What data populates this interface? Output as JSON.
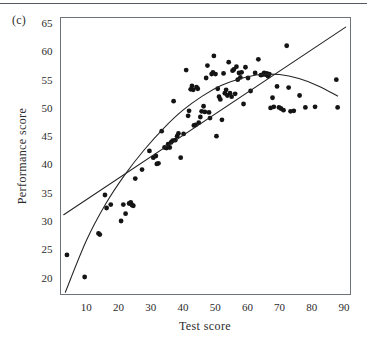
{
  "figure": {
    "panel_label": "(c)",
    "background_color": "#ffffff",
    "rule_color": "#555a60"
  },
  "chart_data": {
    "type": "scatter",
    "title": "",
    "xlabel": "Test score",
    "ylabel": "Performance score",
    "xlim": [
      2,
      92
    ],
    "ylim": [
      17,
      66
    ],
    "grid": false,
    "legend": "none",
    "x_ticks": [
      10,
      20,
      30,
      40,
      50,
      60,
      70,
      80,
      90
    ],
    "y_ticks": [
      20,
      25,
      30,
      35,
      40,
      45,
      50,
      55,
      60,
      65
    ],
    "point_color": "#141414",
    "line_color": "#242424",
    "points": [
      [
        4.0,
        24.0
      ],
      [
        9.5,
        20.1
      ],
      [
        13.8,
        27.8
      ],
      [
        14.2,
        27.6
      ],
      [
        15.8,
        34.6
      ],
      [
        16.3,
        32.3
      ],
      [
        17.6,
        32.9
      ],
      [
        20.8,
        30.0
      ],
      [
        21.5,
        32.9
      ],
      [
        22.2,
        31.3
      ],
      [
        23.3,
        33.1
      ],
      [
        23.8,
        33.3
      ],
      [
        24.2,
        32.8
      ],
      [
        24.6,
        32.7
      ],
      [
        25.2,
        37.5
      ],
      [
        27.3,
        39.1
      ],
      [
        29.6,
        42.4
      ],
      [
        30.8,
        41.2
      ],
      [
        31.6,
        41.5
      ],
      [
        31.9,
        40.1
      ],
      [
        32.4,
        40.2
      ],
      [
        33.4,
        45.9
      ],
      [
        34.3,
        43.0
      ],
      [
        34.9,
        42.9
      ],
      [
        35.4,
        43.6
      ],
      [
        35.9,
        43.0
      ],
      [
        36.3,
        43.9
      ],
      [
        36.8,
        44.2
      ],
      [
        37.1,
        51.2
      ],
      [
        37.6,
        44.3
      ],
      [
        38.2,
        45.0
      ],
      [
        38.6,
        45.5
      ],
      [
        39.3,
        41.2
      ],
      [
        40.2,
        45.4
      ],
      [
        41.0,
        56.7
      ],
      [
        41.6,
        48.6
      ],
      [
        41.9,
        49.5
      ],
      [
        42.4,
        53.3
      ],
      [
        42.8,
        53.9
      ],
      [
        43.2,
        53.2
      ],
      [
        43.4,
        46.9
      ],
      [
        43.9,
        47.0
      ],
      [
        44.2,
        53.7
      ],
      [
        44.6,
        53.4
      ],
      [
        44.9,
        47.4
      ],
      [
        45.4,
        48.4
      ],
      [
        45.8,
        49.4
      ],
      [
        46.4,
        50.3
      ],
      [
        46.8,
        49.3
      ],
      [
        47.2,
        55.3
      ],
      [
        47.6,
        57.5
      ],
      [
        48.1,
        49.2
      ],
      [
        48.4,
        48.2
      ],
      [
        48.9,
        56.0
      ],
      [
        49.3,
        56.3
      ],
      [
        49.6,
        59.2
      ],
      [
        50.1,
        56.0
      ],
      [
        50.4,
        45.0
      ],
      [
        50.8,
        53.4
      ],
      [
        51.2,
        52.0
      ],
      [
        51.6,
        51.5
      ],
      [
        52.1,
        47.9
      ],
      [
        52.6,
        56.1
      ],
      [
        53.0,
        52.6
      ],
      [
        53.4,
        53.2
      ],
      [
        53.8,
        52.2
      ],
      [
        54.2,
        58.1
      ],
      [
        54.6,
        52.6
      ],
      [
        55.1,
        52.0
      ],
      [
        55.4,
        56.6
      ],
      [
        55.8,
        56.8
      ],
      [
        56.2,
        52.5
      ],
      [
        56.6,
        57.3
      ],
      [
        57.0,
        55.0
      ],
      [
        57.4,
        56.2
      ],
      [
        57.8,
        55.4
      ],
      [
        58.2,
        56.3
      ],
      [
        58.8,
        50.7
      ],
      [
        59.4,
        57.2
      ],
      [
        60.2,
        55.3
      ],
      [
        61.0,
        53.0
      ],
      [
        62.4,
        56.2
      ],
      [
        63.4,
        58.6
      ],
      [
        64.2,
        55.8
      ],
      [
        64.8,
        55.9
      ],
      [
        65.2,
        56.2
      ],
      [
        65.6,
        55.9
      ],
      [
        66.0,
        56.1
      ],
      [
        66.4,
        55.6
      ],
      [
        66.8,
        56.0
      ],
      [
        67.2,
        50.0
      ],
      [
        67.8,
        51.8
      ],
      [
        68.2,
        50.2
      ],
      [
        69.2,
        53.8
      ],
      [
        69.8,
        50.1
      ],
      [
        70.4,
        49.9
      ],
      [
        71.2,
        49.6
      ],
      [
        72.2,
        61.0
      ],
      [
        72.8,
        53.6
      ],
      [
        73.4,
        49.4
      ],
      [
        74.4,
        49.5
      ],
      [
        76.2,
        52.2
      ],
      [
        78.0,
        50.1
      ],
      [
        81.0,
        50.2
      ],
      [
        87.6,
        55.0
      ],
      [
        88.0,
        50.1
      ]
    ],
    "fits": [
      {
        "name": "linear-fit",
        "description": "straight-line least squares fit",
        "endpoints": [
          [
            3.0,
            31.1
          ],
          [
            90.5,
            64.3
          ]
        ]
      },
      {
        "name": "quadratic-fit",
        "description": "curved (quadratic) fit rising then flattening and declining",
        "samples": [
          [
            3.5,
            17.4
          ],
          [
            10.0,
            26.5
          ],
          [
            16.0,
            33.0
          ],
          [
            22.0,
            38.2
          ],
          [
            28.0,
            42.6
          ],
          [
            34.0,
            46.4
          ],
          [
            40.0,
            49.6
          ],
          [
            46.0,
            52.1
          ],
          [
            52.0,
            54.0
          ],
          [
            58.0,
            55.2
          ],
          [
            64.0,
            55.9
          ],
          [
            70.0,
            55.9
          ],
          [
            76.0,
            55.2
          ],
          [
            82.0,
            53.9
          ],
          [
            88.0,
            52.1
          ]
        ]
      }
    ]
  }
}
